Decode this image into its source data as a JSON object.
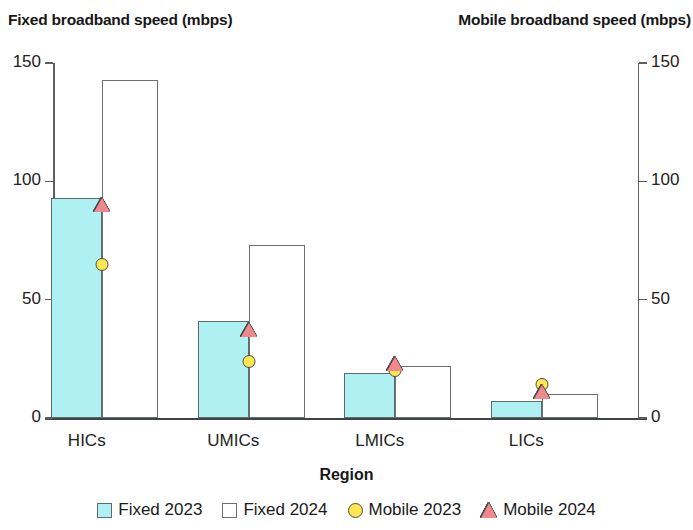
{
  "chart_data": {
    "type": "bar",
    "title": "",
    "xlabel": "Region",
    "categories": [
      "HICs",
      "UMICs",
      "LMICs",
      "LICs"
    ],
    "left_axis": {
      "label": "Fixed broadband speed (mbps)",
      "ticks": [
        0,
        50,
        100,
        150
      ],
      "tick_labels": [
        "0",
        "50",
        "100",
        "150"
      ],
      "ylim": [
        0,
        150
      ]
    },
    "right_axis": {
      "label": "Mobile broadband speed (mbps)",
      "ticks": [
        0,
        50,
        100,
        150
      ],
      "tick_labels": [
        "0",
        "50",
        "100",
        "150"
      ],
      "ylim": [
        0,
        150
      ]
    },
    "grid": false,
    "legend_position": "bottom",
    "series": [
      {
        "name": "Fixed 2023",
        "kind": "bar",
        "axis": "left",
        "color": "#aff0f3",
        "edge_color": "#5e6b6d",
        "values": [
          93,
          41,
          19,
          7
        ]
      },
      {
        "name": "Fixed 2024",
        "kind": "bar",
        "axis": "left",
        "color": "#ffffff",
        "edge_color": "#6b7173",
        "values": [
          143,
          73,
          22,
          10
        ]
      },
      {
        "name": "Mobile 2023",
        "kind": "marker",
        "marker": "circle",
        "axis": "right",
        "color": "#ffe84f",
        "edge_color": "#4a4a4a",
        "values": [
          65,
          24,
          20,
          14
        ]
      },
      {
        "name": "Mobile 2024",
        "kind": "marker",
        "marker": "triangle",
        "axis": "right",
        "color": "#f0888e",
        "edge_color": "#4a4a4a",
        "values": [
          90,
          37,
          23,
          11
        ]
      }
    ]
  },
  "legend": {
    "items": [
      {
        "label": "Fixed 2023",
        "swatch": "square-cyan-icon"
      },
      {
        "label": "Fixed 2024",
        "swatch": "square-white-icon"
      },
      {
        "label": "Mobile 2023",
        "swatch": "circle-yellow-icon"
      },
      {
        "label": "Mobile 2024",
        "swatch": "triangle-pink-icon"
      }
    ]
  }
}
